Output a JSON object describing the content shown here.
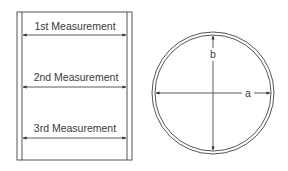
{
  "diagram": {
    "type": "measurement-diagram",
    "colors": {
      "line": "#4a4a4a",
      "text": "#3a3a3a",
      "background": "#ffffff"
    },
    "side_view": {
      "description": "Cylinder side view with three horizontal width measurements",
      "measurements": [
        {
          "label": "1st Measurement",
          "y": 35
        },
        {
          "label": "2nd Measurement",
          "y": 87
        },
        {
          "label": "3rd Measurement",
          "y": 138
        }
      ]
    },
    "top_view": {
      "description": "Circular cross-section with two perpendicular diameter measurements",
      "dimensions": [
        {
          "label": "a",
          "orientation": "horizontal"
        },
        {
          "label": "b",
          "orientation": "vertical"
        }
      ]
    }
  }
}
